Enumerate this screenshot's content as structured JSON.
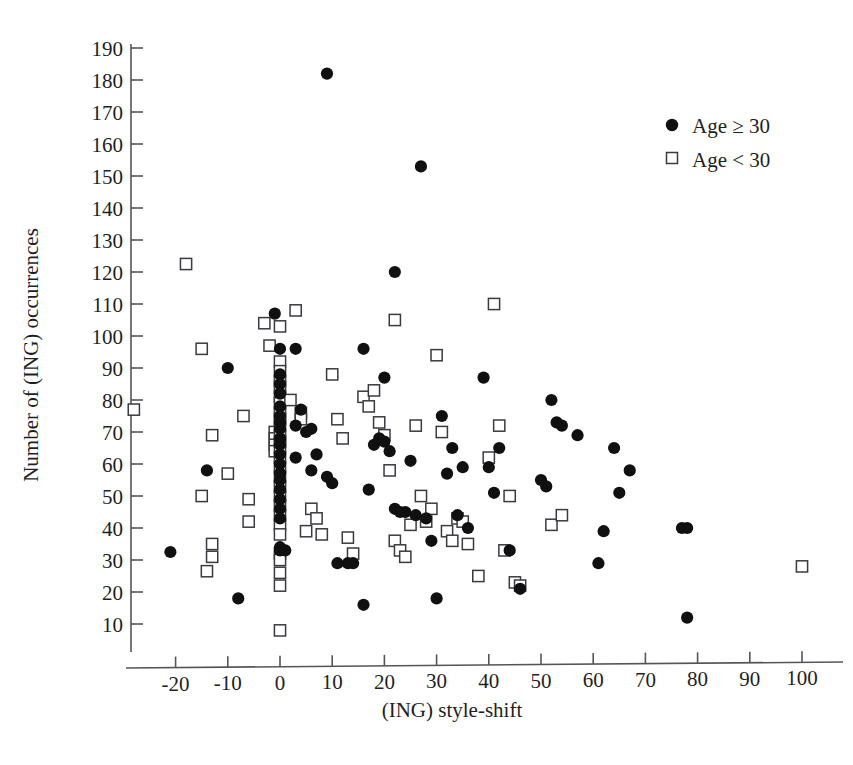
{
  "figure": {
    "background_color": "#ffffff",
    "ink_color": "#1a1a1a",
    "axis_color": "#55545a"
  },
  "chart_data": {
    "type": "scatter",
    "title": "",
    "subtitle": "",
    "xlabel": "(ING) style-shift",
    "ylabel": "Number of (ING) occurrences",
    "xlim": [
      -30,
      105
    ],
    "ylim": [
      0,
      195
    ],
    "xticks": [
      -20,
      -10,
      0,
      10,
      20,
      30,
      40,
      50,
      60,
      70,
      80,
      90,
      100
    ],
    "yticks": [
      10,
      20,
      30,
      40,
      50,
      60,
      70,
      80,
      90,
      100,
      110,
      120,
      130,
      140,
      150,
      160,
      170,
      180,
      190
    ],
    "xtick_labels": [
      "-20",
      "-10",
      "0",
      "10",
      "20",
      "30",
      "40",
      "50",
      "60",
      "70",
      "80",
      "90",
      "100"
    ],
    "ytick_labels": [
      "10",
      "20",
      "30",
      "40",
      "50",
      "60",
      "70",
      "80",
      "90",
      "100",
      "110",
      "120",
      "130",
      "140",
      "150",
      "160",
      "170",
      "180",
      "190"
    ],
    "grid": false,
    "legend_position": "top-right",
    "series": [
      {
        "name": "Age ≥ 30",
        "marker": "filled-circle",
        "color": "#101010",
        "points": [
          [
            -21,
            32.5
          ],
          [
            -14,
            58
          ],
          [
            -10,
            90
          ],
          [
            -8,
            18
          ],
          [
            -1,
            107
          ],
          [
            0,
            96
          ],
          [
            0,
            88
          ],
          [
            0,
            85
          ],
          [
            0,
            82
          ],
          [
            0,
            78
          ],
          [
            0,
            75
          ],
          [
            0,
            73
          ],
          [
            0,
            71
          ],
          [
            0,
            68
          ],
          [
            0,
            66
          ],
          [
            0,
            63
          ],
          [
            0,
            60
          ],
          [
            0,
            57
          ],
          [
            0,
            55
          ],
          [
            0,
            52
          ],
          [
            0,
            49
          ],
          [
            0,
            46
          ],
          [
            0,
            43
          ],
          [
            0,
            34
          ],
          [
            0,
            33
          ],
          [
            1,
            33
          ],
          [
            3,
            96
          ],
          [
            3,
            72
          ],
          [
            3,
            62
          ],
          [
            4,
            77
          ],
          [
            5,
            70
          ],
          [
            6,
            71
          ],
          [
            6,
            58
          ],
          [
            7,
            63
          ],
          [
            9,
            182
          ],
          [
            9,
            56
          ],
          [
            10,
            54
          ],
          [
            11,
            29
          ],
          [
            13,
            29
          ],
          [
            14,
            29
          ],
          [
            16,
            96
          ],
          [
            16,
            16
          ],
          [
            17,
            52
          ],
          [
            18,
            66
          ],
          [
            19,
            68
          ],
          [
            20,
            87
          ],
          [
            20,
            67
          ],
          [
            21,
            64
          ],
          [
            22,
            120
          ],
          [
            22,
            46
          ],
          [
            23,
            45
          ],
          [
            24,
            45
          ],
          [
            25,
            61
          ],
          [
            26,
            44
          ],
          [
            27,
            153
          ],
          [
            28,
            43
          ],
          [
            29,
            36
          ],
          [
            30,
            18
          ],
          [
            31,
            75
          ],
          [
            32,
            57
          ],
          [
            33,
            65
          ],
          [
            34,
            44
          ],
          [
            35,
            59
          ],
          [
            36,
            40
          ],
          [
            39,
            87
          ],
          [
            40,
            59
          ],
          [
            41,
            51
          ],
          [
            42,
            65
          ],
          [
            44,
            33
          ],
          [
            46,
            21
          ],
          [
            50,
            55
          ],
          [
            51,
            53
          ],
          [
            52,
            80
          ],
          [
            53,
            73
          ],
          [
            54,
            72
          ],
          [
            57,
            69
          ],
          [
            61,
            29
          ],
          [
            62,
            39
          ],
          [
            64,
            65
          ],
          [
            65,
            51
          ],
          [
            67,
            58
          ],
          [
            77,
            40
          ],
          [
            78,
            40
          ],
          [
            78,
            12
          ]
        ]
      },
      {
        "name": "Age < 30",
        "marker": "open-square",
        "color": "#3a3a40",
        "points": [
          [
            -28,
            77
          ],
          [
            -18,
            122.5
          ],
          [
            -15,
            96
          ],
          [
            -15,
            50
          ],
          [
            -13,
            69
          ],
          [
            -13,
            35
          ],
          [
            -13,
            31
          ],
          [
            -14,
            26.5
          ],
          [
            -10,
            57
          ],
          [
            -7,
            75
          ],
          [
            -6,
            42
          ],
          [
            -6,
            49
          ],
          [
            -3,
            104
          ],
          [
            -2,
            97
          ],
          [
            -1,
            70
          ],
          [
            -1,
            68
          ],
          [
            -1,
            66
          ],
          [
            -1,
            64
          ],
          [
            0,
            103
          ],
          [
            0,
            92
          ],
          [
            0,
            89
          ],
          [
            0,
            86
          ],
          [
            0,
            84
          ],
          [
            0,
            81
          ],
          [
            0,
            79
          ],
          [
            0,
            76
          ],
          [
            0,
            74
          ],
          [
            0,
            72
          ],
          [
            0,
            69
          ],
          [
            0,
            67
          ],
          [
            0,
            65
          ],
          [
            0,
            62
          ],
          [
            0,
            59
          ],
          [
            0,
            56
          ],
          [
            0,
            53
          ],
          [
            0,
            50
          ],
          [
            0,
            47
          ],
          [
            0,
            44
          ],
          [
            0,
            41
          ],
          [
            0,
            38
          ],
          [
            0,
            32
          ],
          [
            0,
            30
          ],
          [
            0,
            26
          ],
          [
            0,
            22
          ],
          [
            0,
            8
          ],
          [
            2,
            80
          ],
          [
            3,
            108
          ],
          [
            4,
            76
          ],
          [
            4,
            74
          ],
          [
            5,
            39
          ],
          [
            6,
            46
          ],
          [
            7,
            43
          ],
          [
            8,
            38
          ],
          [
            10,
            88
          ],
          [
            11,
            74
          ],
          [
            12,
            68
          ],
          [
            13,
            37
          ],
          [
            14,
            32
          ],
          [
            16,
            81
          ],
          [
            17,
            78
          ],
          [
            18,
            83
          ],
          [
            19,
            73
          ],
          [
            20,
            69
          ],
          [
            21,
            58
          ],
          [
            22,
            105
          ],
          [
            22,
            36
          ],
          [
            23,
            33
          ],
          [
            24,
            31
          ],
          [
            25,
            41
          ],
          [
            26,
            72
          ],
          [
            27,
            50
          ],
          [
            28,
            42
          ],
          [
            29,
            46
          ],
          [
            30,
            94
          ],
          [
            31,
            70
          ],
          [
            32,
            39
          ],
          [
            33,
            36
          ],
          [
            34,
            43
          ],
          [
            35,
            42
          ],
          [
            36,
            35
          ],
          [
            38,
            25
          ],
          [
            40,
            62
          ],
          [
            41,
            110
          ],
          [
            42,
            72
          ],
          [
            43,
            33
          ],
          [
            44,
            50
          ],
          [
            45,
            23
          ],
          [
            46,
            22
          ],
          [
            52,
            41
          ],
          [
            54,
            44
          ],
          [
            100,
            28
          ]
        ]
      }
    ]
  },
  "legend": {
    "items": [
      {
        "label": "Age ≥ 30",
        "marker": "filled-circle"
      },
      {
        "label": "Age < 30",
        "marker": "open-square"
      }
    ]
  },
  "axes": {
    "x_title": "(ING) style-shift",
    "y_title": "Number of (ING) occurrences"
  }
}
